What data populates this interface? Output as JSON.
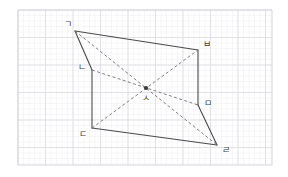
{
  "figure": {
    "canvas": {
      "width": 288,
      "height": 177
    },
    "background": {
      "color": "#ffffff",
      "grid": {
        "visible": true,
        "major_color": "#d8d8e0",
        "minor_color": "#ececf2",
        "major_spacing": 27.5,
        "minor_spacing": 5.5,
        "frame_color": "#d3d3dc",
        "frame": {
          "x": 18,
          "y": 10,
          "width": 254,
          "height": 155
        }
      }
    },
    "stroke": {
      "solid_color": "#4a4a4a",
      "solid_width": 1.1,
      "dashed_color": "#707070",
      "dashed_width": 0.9,
      "dash_pattern": "3,2.4"
    },
    "vertices": [
      {
        "id": "A",
        "label": "ㄱ",
        "x": 75,
        "y": 31,
        "label_x": 68,
        "label_y": 24
      },
      {
        "id": "B",
        "label": "ㄴ",
        "x": 92,
        "y": 70,
        "label_x": 82,
        "label_y": 67
      },
      {
        "id": "C",
        "label": "ㄷ",
        "x": 92,
        "y": 128,
        "label_x": 83,
        "label_y": 134
      },
      {
        "id": "D",
        "label": "ㄹ",
        "x": 217,
        "y": 145,
        "label_x": 226,
        "label_y": 150
      },
      {
        "id": "E",
        "label": "ㅁ",
        "x": 198,
        "y": 105,
        "label_x": 208,
        "label_y": 103
      },
      {
        "id": "F",
        "label": "ㅂ",
        "x": 198,
        "y": 50,
        "label_x": 207,
        "label_y": 44
      },
      {
        "id": "O",
        "label": "ㅅ",
        "x": 146,
        "y": 88,
        "label_x": 146,
        "label_y": 98
      }
    ],
    "solid_edges": [
      {
        "name": "edge-gieuk-bieup",
        "from": "A",
        "to": "F"
      },
      {
        "name": "edge-bieup-mieum",
        "from": "F",
        "to": "E"
      },
      {
        "name": "edge-mieum-rieul",
        "from": "E",
        "to": "D"
      },
      {
        "name": "edge-rieul-digeut",
        "from": "D",
        "to": "C"
      },
      {
        "name": "edge-digeut-nieun",
        "from": "C",
        "to": "B"
      },
      {
        "name": "edge-nieun-gieuk",
        "from": "B",
        "to": "A"
      }
    ],
    "dashed_diagonals": [
      {
        "name": "diagonal-gieuk-rieul",
        "from": "A",
        "to": "D"
      },
      {
        "name": "diagonal-nieun-mieum",
        "from": "B",
        "to": "E"
      },
      {
        "name": "diagonal-digeut-bieup",
        "from": "C",
        "to": "F"
      }
    ],
    "center_point": {
      "name": "center-point-siot",
      "id": "O",
      "radius": 2.1,
      "color": "#3a3a3a"
    }
  }
}
